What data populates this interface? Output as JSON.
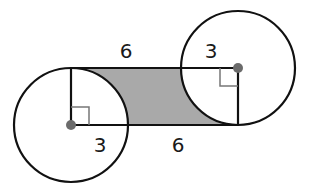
{
  "diagram": {
    "colors": {
      "stroke": "#111111",
      "shade": "#a9a9a9",
      "center_dot": "#6b6b6b",
      "right_angle_mark": "#777777"
    },
    "labels": {
      "top_length": "6",
      "bottom_length": "6",
      "left_radius": "3",
      "right_radius": "3"
    },
    "left_circle": {
      "radius_label": "3"
    },
    "right_circle": {
      "radius_label": "3"
    }
  }
}
